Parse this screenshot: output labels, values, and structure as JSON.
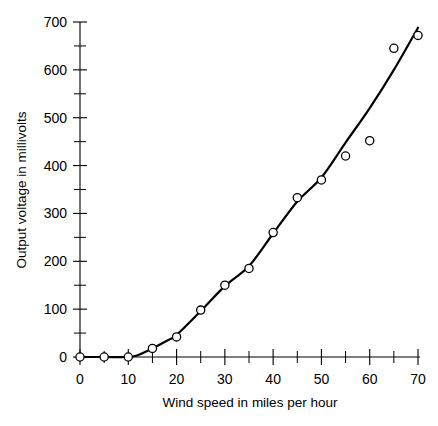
{
  "chart_data": {
    "type": "scatter",
    "title": "",
    "xlabel": "Wind speed in miles per hour",
    "ylabel": "Output voltage in millivolts",
    "xlim": [
      0,
      70
    ],
    "ylim": [
      0,
      700
    ],
    "grid": false,
    "legend": null,
    "x_ticks": [
      0,
      10,
      20,
      30,
      40,
      50,
      60,
      70
    ],
    "x_tick_labels": [
      "0",
      "10",
      "20",
      "30",
      "40",
      "50",
      "60",
      "70"
    ],
    "x_minor_tick_interval": 5,
    "y_ticks": [
      0,
      100,
      200,
      300,
      400,
      500,
      600,
      700
    ],
    "y_tick_labels": [
      "0",
      "100",
      "200",
      "300",
      "400",
      "500",
      "600",
      "700"
    ],
    "y_minor_tick_interval": 50,
    "marker_style": "open-circle",
    "x": [
      0,
      5,
      10,
      15,
      20,
      25,
      30,
      35,
      40,
      45,
      50,
      55,
      60,
      65,
      70
    ],
    "values": [
      0,
      0,
      0,
      18,
      42,
      98,
      150,
      185,
      260,
      333,
      370,
      420,
      452,
      645,
      672
    ],
    "series": [
      {
        "name": "Observed output voltage",
        "x": [
          0,
          5,
          10,
          15,
          20,
          25,
          30,
          35,
          40,
          45,
          50,
          55,
          60,
          65,
          70
        ],
        "values": [
          0,
          0,
          0,
          18,
          42,
          98,
          150,
          185,
          260,
          333,
          370,
          420,
          452,
          645,
          672
        ]
      },
      {
        "name": "Fitted curve",
        "x": [
          0,
          5,
          10,
          12,
          15,
          18,
          20,
          25,
          30,
          35,
          40,
          45,
          50,
          55,
          60,
          65,
          70
        ],
        "values": [
          0,
          0,
          0,
          4,
          18,
          34,
          46,
          96,
          148,
          190,
          258,
          325,
          375,
          448,
          520,
          600,
          688
        ]
      }
    ],
    "colors": {
      "axis": "#000000",
      "curve": "#000000",
      "marker_fill": "#ffffff",
      "marker_edge": "#000000",
      "background": "#ffffff"
    }
  }
}
